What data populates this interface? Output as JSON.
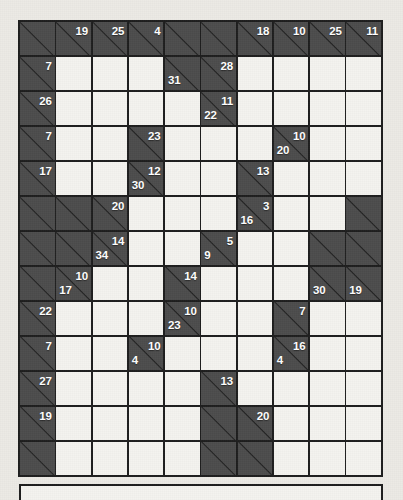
{
  "puzzle": {
    "type": "kakuro",
    "columns": 10,
    "rows": 13,
    "colors": {
      "block": "#4c4c4c",
      "open": "#f4f3ef",
      "grid_line": "#1d1d1d",
      "clue_text": "#ffffff",
      "paper": "#eceae5"
    },
    "cells": [
      [
        {
          "t": "block"
        },
        {
          "t": "block",
          "right": "19"
        },
        {
          "t": "block",
          "right": "25"
        },
        {
          "t": "block",
          "right": "4"
        },
        {
          "t": "block"
        },
        {
          "t": "block"
        },
        {
          "t": "block",
          "right": "18"
        },
        {
          "t": "block",
          "right": "10"
        },
        {
          "t": "block",
          "right": "25"
        },
        {
          "t": "block",
          "right": "11"
        }
      ],
      [
        {
          "t": "block",
          "right": "7"
        },
        {
          "t": "open"
        },
        {
          "t": "open"
        },
        {
          "t": "open"
        },
        {
          "t": "block",
          "down": "31"
        },
        {
          "t": "block",
          "right": "28"
        },
        {
          "t": "open"
        },
        {
          "t": "open"
        },
        {
          "t": "open"
        },
        {
          "t": "open"
        }
      ],
      [
        {
          "t": "block",
          "right": "26"
        },
        {
          "t": "open"
        },
        {
          "t": "open"
        },
        {
          "t": "open"
        },
        {
          "t": "open"
        },
        {
          "t": "block",
          "right": "11",
          "down": "22"
        },
        {
          "t": "open"
        },
        {
          "t": "open"
        },
        {
          "t": "open"
        },
        {
          "t": "open"
        }
      ],
      [
        {
          "t": "block",
          "right": "7"
        },
        {
          "t": "open"
        },
        {
          "t": "open"
        },
        {
          "t": "block",
          "right": "23"
        },
        {
          "t": "open"
        },
        {
          "t": "open"
        },
        {
          "t": "open"
        },
        {
          "t": "block",
          "right": "10",
          "down": "20"
        },
        {
          "t": "open"
        },
        {
          "t": "open"
        }
      ],
      [
        {
          "t": "block",
          "right": "17"
        },
        {
          "t": "open"
        },
        {
          "t": "open"
        },
        {
          "t": "block",
          "right": "12",
          "down": "30"
        },
        {
          "t": "open"
        },
        {
          "t": "open"
        },
        {
          "t": "block",
          "right": "13"
        },
        {
          "t": "open"
        },
        {
          "t": "open"
        },
        {
          "t": "open"
        }
      ],
      [
        {
          "t": "block"
        },
        {
          "t": "block"
        },
        {
          "t": "block",
          "right": "20"
        },
        {
          "t": "open"
        },
        {
          "t": "open"
        },
        {
          "t": "open"
        },
        {
          "t": "block",
          "right": "3",
          "down": "16"
        },
        {
          "t": "open"
        },
        {
          "t": "open"
        },
        {
          "t": "block"
        }
      ],
      [
        {
          "t": "block"
        },
        {
          "t": "block"
        },
        {
          "t": "block",
          "right": "14",
          "down": "34"
        },
        {
          "t": "open"
        },
        {
          "t": "open"
        },
        {
          "t": "block",
          "right": "5",
          "down": "9"
        },
        {
          "t": "open"
        },
        {
          "t": "open"
        },
        {
          "t": "block"
        },
        {
          "t": "block"
        }
      ],
      [
        {
          "t": "block"
        },
        {
          "t": "block",
          "right": "10",
          "down": "17"
        },
        {
          "t": "open"
        },
        {
          "t": "open"
        },
        {
          "t": "block",
          "right": "14"
        },
        {
          "t": "open"
        },
        {
          "t": "open"
        },
        {
          "t": "open"
        },
        {
          "t": "block",
          "down": "30"
        },
        {
          "t": "block",
          "down": "19"
        }
      ],
      [
        {
          "t": "block",
          "right": "22"
        },
        {
          "t": "open"
        },
        {
          "t": "open"
        },
        {
          "t": "open"
        },
        {
          "t": "block",
          "right": "10",
          "down": "23"
        },
        {
          "t": "open"
        },
        {
          "t": "open"
        },
        {
          "t": "block",
          "right": "7"
        },
        {
          "t": "open"
        },
        {
          "t": "open"
        }
      ],
      [
        {
          "t": "block",
          "right": "7"
        },
        {
          "t": "open"
        },
        {
          "t": "open"
        },
        {
          "t": "block",
          "right": "10",
          "down": "4"
        },
        {
          "t": "open"
        },
        {
          "t": "open"
        },
        {
          "t": "open"
        },
        {
          "t": "block",
          "right": "16",
          "down": "4"
        },
        {
          "t": "open"
        },
        {
          "t": "open"
        }
      ],
      [
        {
          "t": "block",
          "right": "27"
        },
        {
          "t": "open"
        },
        {
          "t": "open"
        },
        {
          "t": "open"
        },
        {
          "t": "open"
        },
        {
          "t": "block",
          "right": "13"
        },
        {
          "t": "open"
        },
        {
          "t": "open"
        },
        {
          "t": "open"
        },
        {
          "t": "open"
        }
      ],
      [
        {
          "t": "block",
          "right": "19"
        },
        {
          "t": "open"
        },
        {
          "t": "open"
        },
        {
          "t": "open"
        },
        {
          "t": "open"
        },
        {
          "t": "block"
        },
        {
          "t": "block",
          "right": "20"
        },
        {
          "t": "open"
        },
        {
          "t": "open"
        },
        {
          "t": "open"
        }
      ],
      [
        {
          "t": "block"
        },
        {
          "t": "open"
        },
        {
          "t": "open"
        },
        {
          "t": "open"
        },
        {
          "t": "open"
        },
        {
          "t": "block"
        },
        {
          "t": "block"
        },
        {
          "t": "open"
        },
        {
          "t": "open"
        },
        {
          "t": "open"
        }
      ]
    ]
  },
  "bottom_box": {
    "text": ""
  }
}
